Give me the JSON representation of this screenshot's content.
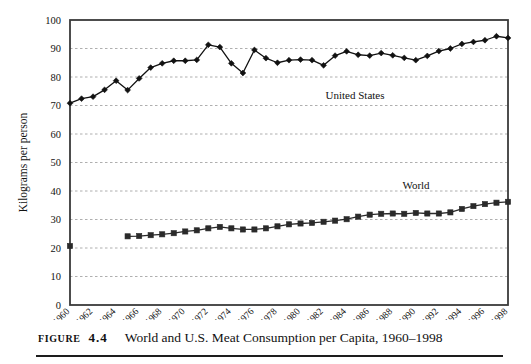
{
  "figure": {
    "caption_kicker": "FIGURE",
    "caption_number": "4.4",
    "caption_title": "World and U.S. Meat Consumption per Capita, 1960–1998"
  },
  "annotations": {
    "united_states": "United States",
    "world": "World"
  },
  "chart_data": {
    "type": "line",
    "title": "World and U.S. Meat Consumption per Capita, 1960–1998",
    "xlabel": "",
    "ylabel": "Kilograms per person",
    "ylim": [
      0,
      100
    ],
    "ytick_step": 10,
    "yticks": [
      0,
      10,
      20,
      30,
      40,
      50,
      60,
      70,
      80,
      90,
      100
    ],
    "ytick_labels": [
      "0",
      "10",
      "20",
      "30",
      "40",
      "50",
      "60",
      "70",
      "80",
      "90",
      "100"
    ],
    "xlim": [
      1960,
      1998
    ],
    "xticks": [
      1960,
      1962,
      1964,
      1966,
      1968,
      1970,
      1972,
      1974,
      1976,
      1978,
      1980,
      1982,
      1984,
      1986,
      1988,
      1990,
      1992,
      1994,
      1996,
      1998
    ],
    "xtick_labels": [
      "1960",
      "1962",
      "1964",
      "1966",
      "1968",
      "1970",
      "1972",
      "1974",
      "1976",
      "1978",
      "1980",
      "1982",
      "1984",
      "1986",
      "1988",
      "1990",
      "1992",
      "1994",
      "1996",
      "1998"
    ],
    "xtick_rotation_deg": 45,
    "grid": "horizontal-dashed",
    "legend_position": "inline-annotation",
    "x": [
      1960,
      1961,
      1962,
      1963,
      1964,
      1965,
      1966,
      1967,
      1968,
      1969,
      1970,
      1971,
      1972,
      1973,
      1974,
      1975,
      1976,
      1977,
      1978,
      1979,
      1980,
      1981,
      1982,
      1983,
      1984,
      1985,
      1986,
      1987,
      1988,
      1989,
      1990,
      1991,
      1992,
      1993,
      1994,
      1995,
      1996,
      1997,
      1998
    ],
    "series": [
      {
        "name": "United States",
        "marker": "diamond",
        "color": "#111111",
        "values": [
          70.8,
          72.4,
          73.1,
          75.5,
          78.7,
          75.4,
          79.5,
          83.3,
          84.8,
          85.7,
          85.7,
          86.0,
          91.3,
          90.5,
          84.8,
          81.4,
          89.5,
          86.6,
          85.0,
          85.9,
          86.1,
          85.9,
          84.1,
          87.5,
          89.0,
          87.8,
          87.5,
          88.4,
          87.6,
          86.7,
          85.9,
          87.4,
          89.1,
          90.0,
          91.6,
          92.3,
          92.9,
          94.3,
          93.7
        ]
      },
      {
        "name": "World",
        "marker": "square",
        "color": "#2a2a2a",
        "values": [
          20.7,
          null,
          null,
          null,
          null,
          24.1,
          24.2,
          24.5,
          24.8,
          25.2,
          25.8,
          26.2,
          26.9,
          27.4,
          26.9,
          26.5,
          26.5,
          26.9,
          27.6,
          28.3,
          28.6,
          28.8,
          29.2,
          29.6,
          30.1,
          31.0,
          31.7,
          32.0,
          32.1,
          32.0,
          32.3,
          32.1,
          32.1,
          32.5,
          33.7,
          34.7,
          35.4,
          35.9,
          36.2
        ]
      }
    ]
  }
}
